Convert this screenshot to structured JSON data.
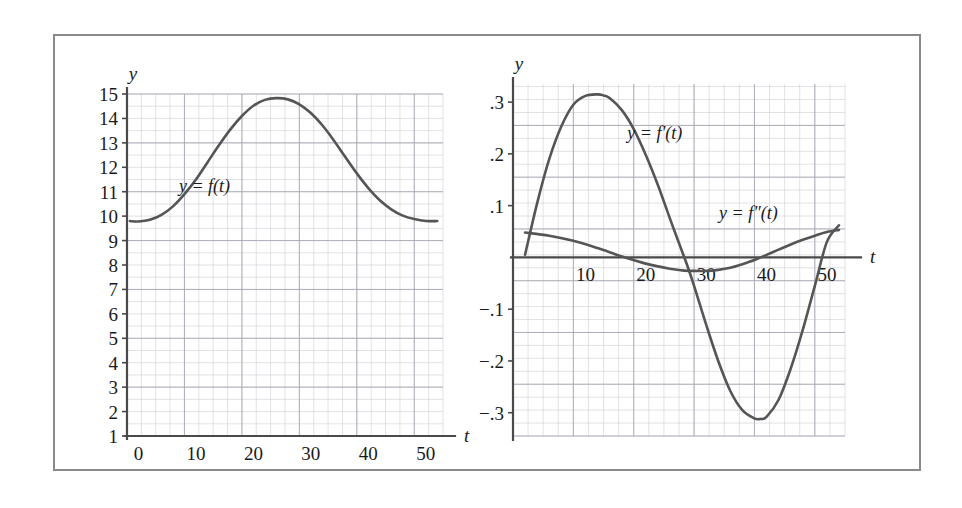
{
  "figure": {
    "border_color": "#8a8a8a",
    "background": "#ffffff",
    "curve_color": "#555555",
    "grid_color": "#c9c9d2"
  },
  "chart_data": [
    {
      "id": "left",
      "type": "line",
      "title": "",
      "xlabel": "t",
      "ylabel": "y",
      "xlim": [
        -2,
        53
      ],
      "ylim": [
        1,
        15
      ],
      "xticks": [
        0,
        10,
        20,
        30,
        40,
        50
      ],
      "xticklabels": [
        "0",
        "10",
        "20",
        "30",
        "40",
        "50"
      ],
      "yticks": [
        1,
        2,
        3,
        4,
        5,
        6,
        7,
        8,
        9,
        10,
        11,
        12,
        13,
        14,
        15
      ],
      "yticklabels": [
        "1",
        "2",
        "3",
        "4",
        "5",
        "6",
        "7",
        "8",
        "9",
        "10",
        "11",
        "12",
        "13",
        "14",
        "15"
      ],
      "grid": true,
      "grid_minor_step_x": 2.5,
      "grid_minor_step_y": 0.5,
      "series": [
        {
          "name": "y = f(t)",
          "label_text": "y = f(t)",
          "label_x": 11.5,
          "label_y": 11.0,
          "x": [
            -1.5,
            0,
            2,
            4,
            6,
            8,
            10,
            12,
            14,
            16,
            18,
            20,
            22,
            24,
            26,
            28,
            30,
            32,
            34,
            36,
            38,
            40,
            42,
            44,
            46,
            48,
            50,
            52
          ],
          "y": [
            9.8,
            9.78,
            9.85,
            10.05,
            10.4,
            10.9,
            11.5,
            12.2,
            12.9,
            13.55,
            14.1,
            14.52,
            14.76,
            14.83,
            14.78,
            14.58,
            14.22,
            13.72,
            13.1,
            12.42,
            11.75,
            11.15,
            10.65,
            10.28,
            10.02,
            9.88,
            9.8,
            9.8
          ]
        }
      ]
    },
    {
      "id": "right",
      "type": "line",
      "title": "",
      "xlabel": "t",
      "ylabel": "y",
      "xlim": [
        -2,
        53
      ],
      "ylim": [
        -0.345,
        0.335
      ],
      "xticks": [
        10,
        20,
        30,
        40,
        50
      ],
      "xticklabels": [
        "10",
        "20",
        "30",
        "40",
        "50"
      ],
      "yticks": [
        -0.3,
        -0.2,
        -0.1,
        0.1,
        0.2,
        0.3
      ],
      "yticklabels": [
        "−.3",
        "−.2",
        "−.1",
        ".1",
        ".2",
        ".3"
      ],
      "grid": true,
      "grid_minor_step_x": 2.5,
      "grid_minor_step_y": 0.025,
      "series": [
        {
          "name": "y = f'(t)",
          "label_text": "y = f′(t)",
          "label_x": 21.5,
          "label_y": 0.228,
          "x": [
            0,
            2,
            4,
            6,
            8,
            10,
            12,
            13,
            14,
            16,
            18,
            20,
            22,
            24,
            26,
            27,
            28,
            30,
            32,
            34,
            36,
            38,
            39,
            40,
            42,
            44,
            46,
            48,
            50,
            52
          ],
          "y": [
            0.005,
            0.105,
            0.19,
            0.253,
            0.295,
            0.312,
            0.315,
            0.313,
            0.308,
            0.285,
            0.248,
            0.198,
            0.14,
            0.075,
            0.012,
            -0.02,
            -0.055,
            -0.13,
            -0.2,
            -0.258,
            -0.295,
            -0.311,
            -0.312,
            -0.308,
            -0.275,
            -0.215,
            -0.14,
            -0.055,
            0.03,
            0.062
          ]
        },
        {
          "name": "y = f''(t)",
          "label_text": "y = f″(t)",
          "label_x": 37.0,
          "label_y": 0.075,
          "x": [
            0,
            4,
            8,
            12,
            16,
            20,
            24,
            26,
            28,
            30,
            32,
            34,
            36,
            38,
            40,
            42,
            44,
            46,
            48,
            50,
            52
          ],
          "y": [
            0.048,
            0.042,
            0.032,
            0.018,
            0.002,
            -0.012,
            -0.022,
            -0.025,
            -0.026,
            -0.026,
            -0.024,
            -0.02,
            -0.013,
            -0.005,
            0.005,
            0.015,
            0.025,
            0.034,
            0.042,
            0.049,
            0.053
          ]
        }
      ]
    }
  ]
}
